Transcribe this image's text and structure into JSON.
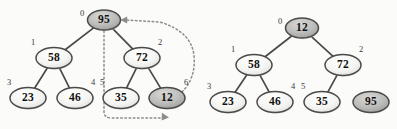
{
  "figure": {
    "background_color": "#fbfbf9",
    "node_fill_plain": "#f2f2f2",
    "node_fill_shaded": "#b8b8b8",
    "node_stroke": "#4a4a4a",
    "edge_color": "#4a4a4a",
    "dotted_color": "#8c8c8c",
    "label_color": "#3a3a3a"
  },
  "diagrams": [
    {
      "name": "before-swap",
      "nodes": [
        {
          "id": "L0",
          "label": "95",
          "index": "0",
          "shaded": true,
          "cx": 104,
          "cy": 20,
          "rx": 16.5,
          "ry": 10.0,
          "index_x": 82,
          "index_y": 14
        },
        {
          "id": "L1",
          "label": "58",
          "index": "1",
          "shaded": false,
          "cx": 54,
          "cy": 58,
          "rx": 18.0,
          "ry": 10.5,
          "index_x": 33,
          "index_y": 43
        },
        {
          "id": "L2",
          "label": "72",
          "index": "2",
          "shaded": false,
          "cx": 142,
          "cy": 58,
          "rx": 18.0,
          "ry": 10.5,
          "index_x": 160,
          "index_y": 43
        },
        {
          "id": "L3",
          "label": "23",
          "index": "3",
          "shaded": false,
          "cx": 28,
          "cy": 98,
          "rx": 18.0,
          "ry": 10.5,
          "index_x": 9,
          "index_y": 83
        },
        {
          "id": "L4",
          "label": "46",
          "index": "4",
          "shaded": false,
          "cx": 75,
          "cy": 98,
          "rx": 18.0,
          "ry": 10.5,
          "index_x": 93,
          "index_y": 83
        },
        {
          "id": "L5",
          "label": "35",
          "index": "5",
          "shaded": false,
          "cx": 121,
          "cy": 98,
          "rx": 18.0,
          "ry": 10.5,
          "index_x": 102,
          "index_y": 83
        },
        {
          "id": "L6",
          "label": "12",
          "index": "6",
          "shaded": true,
          "cx": 167,
          "cy": 98,
          "rx": 18.0,
          "ry": 10.5,
          "index_x": 186,
          "index_y": 83
        }
      ],
      "edges": [
        {
          "from": "L0",
          "to": "L1"
        },
        {
          "from": "L0",
          "to": "L2"
        },
        {
          "from": "L1",
          "to": "L3"
        },
        {
          "from": "L1",
          "to": "L4"
        },
        {
          "from": "L2",
          "to": "L5"
        },
        {
          "from": "L2",
          "to": "L6"
        }
      ],
      "swap_arrows": [
        {
          "name": "swap-arrow-root-to-leaf",
          "path": "M 104 31 L 104 112 Q 104 118 112 118 L 162 118",
          "arrow_at": [
            168,
            116
          ]
        },
        {
          "name": "swap-arrow-leaf-to-root",
          "path": "M 182 92 Q 196 78 194 56 Q 192 32 160 22 L 126 20",
          "arrow_at": [
            121,
            20
          ]
        }
      ]
    },
    {
      "name": "after-swap",
      "nodes": [
        {
          "id": "R0",
          "label": "12",
          "index": "0",
          "shaded": true,
          "cx": 302,
          "cy": 28,
          "rx": 16.5,
          "ry": 10.0,
          "index_x": 280,
          "index_y": 22
        },
        {
          "id": "R1",
          "label": "58",
          "index": "1",
          "shaded": false,
          "cx": 254,
          "cy": 65,
          "rx": 18.0,
          "ry": 10.5,
          "index_x": 233,
          "index_y": 50
        },
        {
          "id": "R2",
          "label": "72",
          "index": "2",
          "shaded": false,
          "cx": 343,
          "cy": 65,
          "rx": 18.0,
          "ry": 10.5,
          "index_x": 361,
          "index_y": 50
        },
        {
          "id": "R3",
          "label": "23",
          "index": "3",
          "shaded": false,
          "cx": 228,
          "cy": 102,
          "rx": 18.0,
          "ry": 10.5,
          "index_x": 209,
          "index_y": 87
        },
        {
          "id": "R4",
          "label": "46",
          "index": "4",
          "shaded": false,
          "cx": 275,
          "cy": 102,
          "rx": 18.0,
          "ry": 10.5,
          "index_x": 293,
          "index_y": 87
        },
        {
          "id": "R5",
          "label": "35",
          "index": "5",
          "shaded": false,
          "cx": 322,
          "cy": 102,
          "rx": 18.0,
          "ry": 10.5,
          "index_x": 303,
          "index_y": 87
        },
        {
          "id": "R6",
          "label": "95",
          "index": "",
          "shaded": true,
          "cx": 371,
          "cy": 102,
          "rx": 18.0,
          "ry": 10.5,
          "index_x": 0,
          "index_y": 0
        }
      ],
      "edges": [
        {
          "from": "R0",
          "to": "R1"
        },
        {
          "from": "R0",
          "to": "R2"
        },
        {
          "from": "R1",
          "to": "R3"
        },
        {
          "from": "R1",
          "to": "R4"
        },
        {
          "from": "R2",
          "to": "R5"
        }
      ],
      "swap_arrows": []
    }
  ]
}
